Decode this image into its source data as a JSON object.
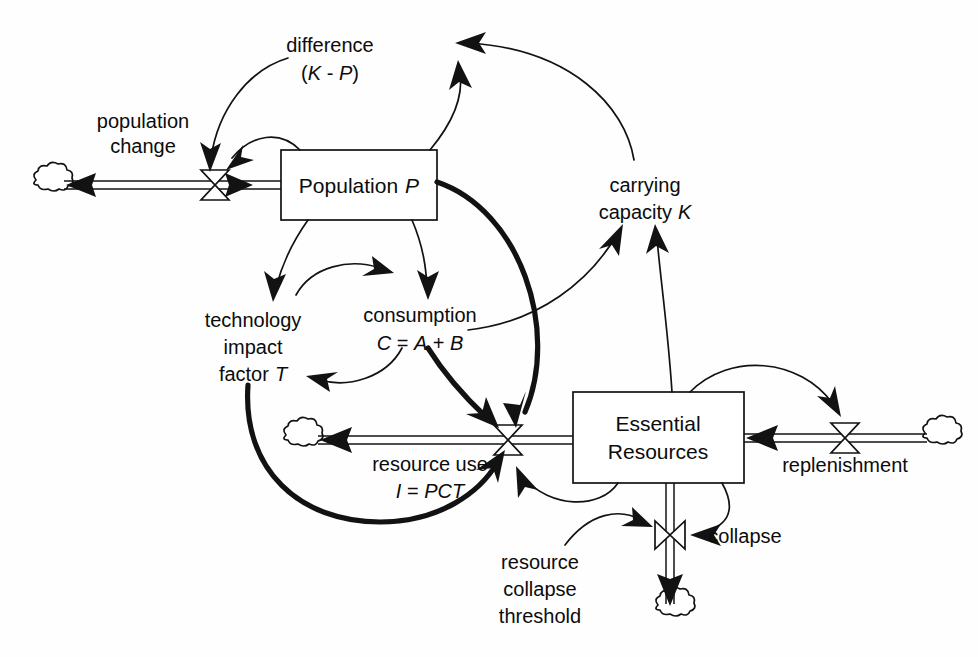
{
  "diagram": {
    "type": "system-dynamics-stock-and-flow",
    "background_color": "#fefefe",
    "ink_color": "#121212",
    "width": 978,
    "height": 657
  },
  "stocks": [
    {
      "id": "population",
      "label": "Population P",
      "label_plain": "Population",
      "label_italic": "P",
      "x": 281,
      "y": 150,
      "w": 156,
      "h": 70
    },
    {
      "id": "essential_resources",
      "label_line1": "Essential",
      "label_line2": "Resources",
      "x": 573,
      "y": 392,
      "w": 171,
      "h": 91
    }
  ],
  "flows": [
    {
      "id": "population_change",
      "label": "population change",
      "label_line1": "population",
      "label_line2": "change",
      "valve_x": 215,
      "valve_y": 185,
      "source": "cloud-left-top",
      "target": "population",
      "direction": "right"
    },
    {
      "id": "resource_use",
      "label_line1": "resource use",
      "label_line2": "I = PCT",
      "formula_italic": "I = PCT",
      "valve_x": 508,
      "valve_y": 440,
      "source": "essential_resources",
      "target": "cloud-left-bottom",
      "direction": "left"
    },
    {
      "id": "replenishment",
      "label": "replenishment",
      "valve_x": 845,
      "valve_y": 438,
      "source": "cloud-right",
      "target": "essential_resources",
      "direction": "left"
    },
    {
      "id": "collapse",
      "label": "collapse",
      "valve_x": 670,
      "valve_y": 535,
      "source": "essential_resources",
      "target": "cloud-bottom",
      "direction": "down"
    }
  ],
  "auxiliaries": [
    {
      "id": "difference",
      "label_line1": "difference",
      "label_line2": "(K - P)",
      "italic_vars": [
        "K",
        "P"
      ],
      "x": 330,
      "y": 45
    },
    {
      "id": "carrying_capacity",
      "label_line1": "carrying",
      "label_line2": "capacity K",
      "italic_vars": [
        "K"
      ],
      "x": 645,
      "y": 185
    },
    {
      "id": "technology_impact_factor",
      "label_line1": "technology",
      "label_line2": "impact",
      "label_line3": "factor T",
      "italic_vars": [
        "T"
      ],
      "x": 253,
      "y": 320
    },
    {
      "id": "consumption",
      "label_line1": "consumption",
      "label_line2": "C = A + B",
      "italic_vars": [
        "C",
        "A",
        "B"
      ],
      "x": 412,
      "y": 315
    },
    {
      "id": "resource_collapse_threshold",
      "label_line1": "resource",
      "label_line2": "collapse",
      "label_line3": "threshold",
      "x": 540,
      "y": 562
    }
  ],
  "clouds": [
    {
      "id": "cloud-left-top",
      "x": 48,
      "y": 185
    },
    {
      "id": "cloud-left-bottom",
      "x": 298,
      "y": 440
    },
    {
      "id": "cloud-right",
      "x": 937,
      "y": 438
    },
    {
      "id": "cloud-bottom",
      "x": 670,
      "y": 610
    }
  ],
  "links": [
    {
      "id": "link-difference-to-population-change",
      "from": "difference",
      "to": "population_change",
      "weight": "thin"
    },
    {
      "id": "link-population-to-population-change",
      "from": "population",
      "to": "population_change",
      "weight": "thin"
    },
    {
      "id": "link-carrying-capacity-to-difference",
      "from": "carrying_capacity",
      "to": "difference",
      "weight": "thin"
    },
    {
      "id": "link-population-to-difference",
      "from": "population",
      "to": "difference",
      "weight": "thin"
    },
    {
      "id": "link-population-to-technology",
      "from": "population",
      "to": "technology_impact_factor",
      "weight": "thin"
    },
    {
      "id": "link-population-to-consumption",
      "from": "population",
      "to": "consumption",
      "weight": "thin"
    },
    {
      "id": "link-technology-to-consumption",
      "from": "technology_impact_factor",
      "to": "consumption",
      "weight": "thin"
    },
    {
      "id": "link-consumption-to-technology",
      "from": "consumption",
      "to": "technology_impact_factor",
      "weight": "thin"
    },
    {
      "id": "link-consumption-to-carrying-capacity",
      "from": "consumption",
      "to": "carrying_capacity",
      "weight": "thin"
    },
    {
      "id": "link-resources-to-carrying-capacity",
      "from": "essential_resources",
      "to": "carrying_capacity",
      "weight": "thin"
    },
    {
      "id": "link-population-to-resource-use",
      "from": "population",
      "to": "resource_use",
      "weight": "thick"
    },
    {
      "id": "link-consumption-to-resource-use",
      "from": "consumption",
      "to": "resource_use",
      "weight": "thick"
    },
    {
      "id": "link-technology-to-resource-use",
      "from": "technology_impact_factor",
      "to": "resource_use",
      "weight": "thick"
    },
    {
      "id": "link-resources-to-resource-use",
      "from": "essential_resources",
      "to": "resource_use",
      "weight": "thin"
    },
    {
      "id": "link-threshold-to-collapse",
      "from": "resource_collapse_threshold",
      "to": "collapse",
      "weight": "thin"
    },
    {
      "id": "link-resources-to-collapse",
      "from": "essential_resources",
      "to": "collapse",
      "weight": "thin"
    },
    {
      "id": "link-resources-to-replenishment",
      "from": "essential_resources",
      "to": "replenishment",
      "weight": "thin"
    }
  ]
}
